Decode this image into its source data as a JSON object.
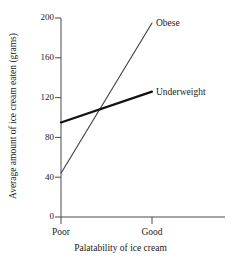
{
  "chart_data": {
    "type": "line",
    "title": "",
    "xlabel": "Palatability of ice cream",
    "ylabel": "Average amount of ice cream eaten (grams)",
    "categories": [
      "Poor",
      "Good"
    ],
    "ylim": [
      0,
      200
    ],
    "yticks": [
      0,
      40,
      80,
      120,
      160,
      200
    ],
    "ytick_labels": [
      "0",
      "40",
      "80",
      "120",
      "160",
      "200"
    ],
    "grid": false,
    "legend_position": "inline-right-of-line-ends",
    "series": [
      {
        "name": "Obese",
        "values": [
          44,
          195
        ],
        "color": "#3d3d3d",
        "line_width": 1.1,
        "label_x": 152,
        "label_y": 195
      },
      {
        "name": "Underweight",
        "values": [
          95,
          126
        ],
        "color": "#111111",
        "line_width": 2.2,
        "label_x": 152,
        "label_y": 126
      }
    ],
    "annotations": [
      {
        "text": "Obese",
        "series": "Obese"
      },
      {
        "text": "Underweight",
        "series": "Underweight"
      }
    ],
    "axis_color": "#4a4a4a"
  },
  "axes": {
    "y_tick_0": "0",
    "y_tick_1": "40",
    "y_tick_2": "80",
    "y_tick_3": "120",
    "y_tick_4": "160",
    "y_tick_5": "200",
    "x_tick_0": "Poor",
    "x_tick_1": "Good"
  }
}
